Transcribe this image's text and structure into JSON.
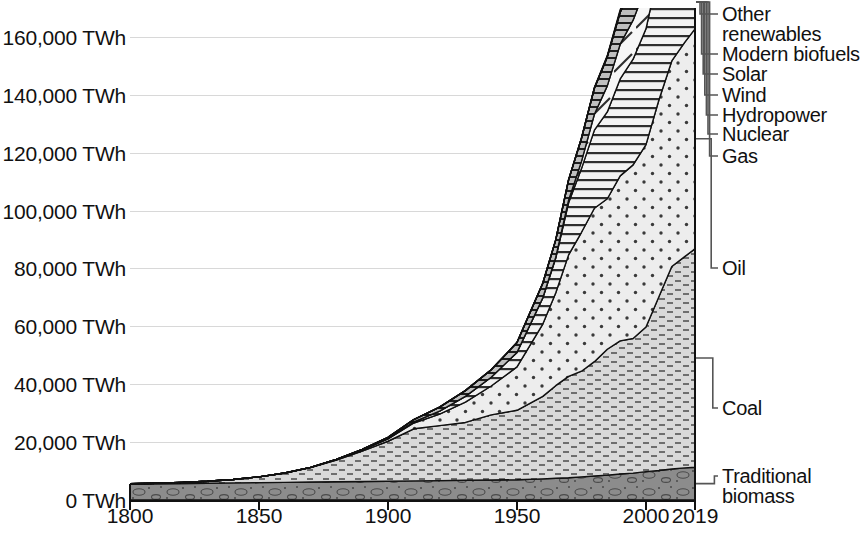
{
  "chart_data": {
    "type": "area",
    "stacked": true,
    "title": "",
    "subtitle": "",
    "xlabel": "",
    "ylabel": "",
    "unit": "TWh",
    "xlim": [
      1800,
      2019
    ],
    "ylim": [
      0,
      170000
    ],
    "grid": true,
    "legend_position": "right-inline-labels",
    "y_ticks": [
      {
        "value": 0,
        "label": "0 TWh"
      },
      {
        "value": 20000,
        "label": "20,000 TWh"
      },
      {
        "value": 40000,
        "label": "40,000 TWh"
      },
      {
        "value": 60000,
        "label": "60,000 TWh"
      },
      {
        "value": 80000,
        "label": "80,000 TWh"
      },
      {
        "value": 100000,
        "label": "100,000 TWh"
      },
      {
        "value": 120000,
        "label": "120,000 TWh"
      },
      {
        "value": 140000,
        "label": "140,000 TWh"
      },
      {
        "value": 160000,
        "label": "160,000 TWh"
      }
    ],
    "x_ticks": [
      {
        "value": 1800,
        "label": "1800"
      },
      {
        "value": 1850,
        "label": "1850"
      },
      {
        "value": 1900,
        "label": "1900"
      },
      {
        "value": 1950,
        "label": "1950"
      },
      {
        "value": 2000,
        "label": "2000"
      },
      {
        "value": 2019,
        "label": "2019"
      }
    ],
    "x": [
      1800,
      1810,
      1820,
      1830,
      1840,
      1850,
      1860,
      1870,
      1880,
      1890,
      1900,
      1910,
      1920,
      1930,
      1940,
      1950,
      1960,
      1965,
      1970,
      1975,
      1980,
      1985,
      1990,
      1995,
      2000,
      2005,
      2010,
      2015,
      2019
    ],
    "series": [
      {
        "name": "Traditional biomass",
        "fill": "#8c8c8c",
        "pattern": "ovals",
        "values": [
          5500,
          5600,
          5700,
          5800,
          5900,
          6000,
          6100,
          6200,
          6300,
          6400,
          6500,
          6600,
          6700,
          6800,
          6900,
          7000,
          7300,
          7500,
          7700,
          8000,
          8300,
          8600,
          9000,
          9300,
          9800,
          10200,
          10700,
          11100,
          11300
        ]
      },
      {
        "name": "Coal",
        "fill": "#d9d9d9",
        "pattern": "dashes",
        "values": [
          100,
          200,
          400,
          700,
          1200,
          2000,
          3200,
          5000,
          7500,
          10500,
          13800,
          18000,
          19000,
          20000,
          22500,
          24000,
          28500,
          32000,
          35000,
          36500,
          39500,
          43500,
          46000,
          46500,
          50000,
          60000,
          70000,
          73000,
          75500
        ]
      },
      {
        "name": "Oil",
        "fill": "#ededed",
        "pattern": "dots",
        "values": [
          0,
          0,
          0,
          0,
          0,
          0,
          30,
          90,
          200,
          400,
          800,
          2000,
          4000,
          7000,
          10000,
          15000,
          25000,
          32000,
          42000,
          48000,
          53000,
          52000,
          57000,
          60000,
          63000,
          68000,
          71000,
          74000,
          76000
        ]
      },
      {
        "name": "Gas",
        "fill": "#f2f2f2",
        "pattern": "hlines",
        "values": [
          0,
          0,
          0,
          0,
          0,
          0,
          0,
          0,
          10,
          40,
          120,
          400,
          1000,
          2000,
          3000,
          5000,
          9000,
          12000,
          18000,
          22000,
          27000,
          30000,
          33500,
          36500,
          40000,
          45000,
          50000,
          55000,
          59000
        ]
      },
      {
        "name": "Nuclear",
        "fill": "#f7f7f7",
        "pattern": "slashes",
        "values": [
          0,
          0,
          0,
          0,
          0,
          0,
          0,
          0,
          0,
          0,
          0,
          0,
          0,
          0,
          0,
          0,
          100,
          300,
          900,
          2500,
          5500,
          9000,
          12000,
          13500,
          14500,
          15000,
          15000,
          14000,
          14500
        ]
      },
      {
        "name": "Hydropower",
        "fill": "#bfbfbf",
        "pattern": "hlines2",
        "values": [
          0,
          0,
          0,
          0,
          0,
          0,
          0,
          0,
          40,
          150,
          400,
          800,
          1400,
          2000,
          2600,
          3400,
          5000,
          6000,
          7000,
          8000,
          9000,
          10000,
          11000,
          12000,
          13000,
          14500,
          16500,
          18000,
          19000
        ]
      },
      {
        "name": "Wind",
        "fill": "#a6a6a6",
        "pattern": "crosshatch",
        "values": [
          0,
          0,
          0,
          0,
          0,
          0,
          0,
          0,
          0,
          0,
          0,
          0,
          0,
          0,
          0,
          0,
          0,
          0,
          0,
          0,
          0,
          10,
          100,
          200,
          800,
          1500,
          3500,
          8500,
          14000
        ]
      },
      {
        "name": "Solar",
        "fill": "#9a9a9a",
        "pattern": "grid",
        "values": [
          0,
          0,
          0,
          0,
          0,
          0,
          0,
          0,
          0,
          0,
          0,
          0,
          0,
          0,
          0,
          0,
          0,
          0,
          0,
          0,
          0,
          0,
          10,
          20,
          50,
          200,
          800,
          3500,
          7000
        ]
      },
      {
        "name": "Modern biofuels",
        "fill": "#b3b3b3",
        "pattern": "hlines3",
        "values": [
          0,
          0,
          0,
          0,
          0,
          0,
          0,
          0,
          0,
          0,
          0,
          0,
          0,
          0,
          0,
          0,
          0,
          0,
          0,
          0,
          50,
          150,
          300,
          500,
          1000,
          1800,
          3000,
          3900,
          4400
        ]
      },
      {
        "name": "Other renewables",
        "fill": "#8f8f8f",
        "pattern": "vlines",
        "values": [
          0,
          0,
          0,
          0,
          0,
          0,
          0,
          0,
          0,
          0,
          0,
          0,
          0,
          0,
          0,
          0,
          0,
          0,
          0,
          50,
          150,
          300,
          500,
          800,
          1200,
          1800,
          2500,
          3200,
          4000
        ]
      }
    ],
    "annotations": [
      {
        "label": "Other\nrenewables",
        "series": "Other renewables"
      },
      {
        "label": "Modern biofuels",
        "series": "Modern biofuels"
      },
      {
        "label": "Solar",
        "series": "Solar"
      },
      {
        "label": "Wind",
        "series": "Wind"
      },
      {
        "label": "Hydropower",
        "series": "Hydropower"
      },
      {
        "label": "Nuclear",
        "series": "Nuclear"
      },
      {
        "label": "Gas",
        "series": "Gas"
      },
      {
        "label": "Oil",
        "series": "Oil"
      },
      {
        "label": "Coal",
        "series": "Coal"
      },
      {
        "label": "Traditional\nbiomass",
        "series": "Traditional biomass"
      }
    ]
  },
  "legend": {
    "items": [
      {
        "line1": "Other",
        "line2": "renewables"
      },
      {
        "line1": "Modern biofuels",
        "line2": ""
      },
      {
        "line1": "Solar",
        "line2": ""
      },
      {
        "line1": "Wind",
        "line2": ""
      },
      {
        "line1": "Hydropower",
        "line2": ""
      },
      {
        "line1": "Nuclear",
        "line2": ""
      },
      {
        "line1": "Gas",
        "line2": ""
      },
      {
        "line1": "Oil",
        "line2": ""
      },
      {
        "line1": "Coal",
        "line2": ""
      },
      {
        "line1": "Traditional",
        "line2": "biomass"
      }
    ]
  },
  "colors": {
    "axis": "#111111",
    "grid": "#d8d8d8",
    "background": "#ffffff"
  }
}
